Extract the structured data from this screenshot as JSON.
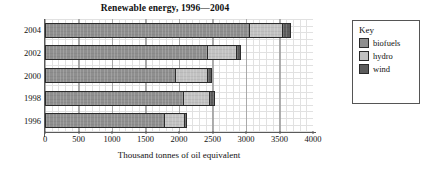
{
  "chart_data": {
    "type": "bar",
    "orientation": "horizontal",
    "stacked": true,
    "title": "Renewable energy, 1996—2004",
    "xlabel": "Thousand tonnes of oil equivalent",
    "ylabel": "",
    "xlim": [
      0,
      4000
    ],
    "xticks": [
      0,
      500,
      1000,
      1500,
      2000,
      2500,
      3000,
      3500,
      4000
    ],
    "xtick_labels": [
      "0",
      "500",
      "1000",
      "1500",
      "2000",
      "2500",
      "3000",
      "3500",
      "4000"
    ],
    "grid": true,
    "legend_position": "right",
    "legend_title": "Key",
    "categories": [
      "2004",
      "2002",
      "2000",
      "1998",
      "1996"
    ],
    "series": [
      {
        "name": "biofuels",
        "color": "#8f8f8f",
        "values": [
          3060,
          2430,
          1960,
          2080,
          1790
        ]
      },
      {
        "name": "hydro",
        "color": "#c2c2c2",
        "values": [
          500,
          450,
          490,
          400,
          320
        ]
      },
      {
        "name": "wind",
        "color": "#5c5c5c",
        "values": [
          140,
          70,
          70,
          80,
          40
        ]
      }
    ],
    "totals": [
      3700,
      2950,
      2520,
      2560,
      2150
    ]
  },
  "legend": {
    "title": "Key",
    "items": [
      {
        "label": "biofuels",
        "color": "#8f8f8f"
      },
      {
        "label": "hydro",
        "color": "#c2c2c2"
      },
      {
        "label": "wind",
        "color": "#5c5c5c"
      }
    ]
  }
}
